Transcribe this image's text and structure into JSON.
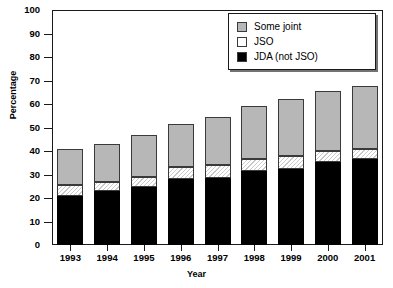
{
  "chart_data": {
    "type": "bar",
    "subtype": "stacked-bar",
    "title": "",
    "xlabel": "Year",
    "ylabel": "Percentage",
    "categories": [
      "1993",
      "1994",
      "1995",
      "1996",
      "1997",
      "1998",
      "1999",
      "2000",
      "2001"
    ],
    "ylim": [
      0,
      100
    ],
    "yticks": [
      0,
      10,
      20,
      30,
      40,
      50,
      60,
      70,
      80,
      90,
      100
    ],
    "ytick_labels": [
      "0",
      "10",
      "20",
      "30",
      "40",
      "50",
      "60",
      "70",
      "80",
      "90",
      "100"
    ],
    "grid": false,
    "legend_position": "top-right",
    "stack_order_bottom_to_top": [
      "JDA (not JSO)",
      "JSO",
      "Some joint"
    ],
    "series": [
      {
        "name": "JDA (not JSO)",
        "color": "#000000",
        "values": [
          21,
          23,
          24.5,
          28,
          28.5,
          31.5,
          32.5,
          35.5,
          36.5
        ]
      },
      {
        "name": "JSO",
        "color": "#ffffff",
        "values": [
          4.5,
          4,
          4.5,
          5,
          5.5,
          5,
          5.5,
          4.5,
          4.5
        ]
      },
      {
        "name": "Some joint",
        "color": "#b7b7b7",
        "values": [
          15.5,
          16,
          18,
          18.5,
          20.5,
          22.5,
          24,
          25.5,
          26.5
        ]
      }
    ],
    "cumulative_tops": {
      "jda": [
        21,
        23,
        24.5,
        28,
        28.5,
        31.5,
        32.5,
        35.5,
        36.5
      ],
      "jso": [
        25.5,
        27,
        29,
        33,
        34,
        36.5,
        38,
        40,
        41
      ],
      "total": [
        41,
        43,
        47,
        51.5,
        54.5,
        59,
        62,
        65.5,
        67.5
      ]
    }
  },
  "legend": {
    "items": [
      {
        "label": "Some joint",
        "swatch": "gray"
      },
      {
        "label": "JSO",
        "swatch": "white"
      },
      {
        "label": "JDA (not JSO)",
        "swatch": "black"
      }
    ]
  }
}
